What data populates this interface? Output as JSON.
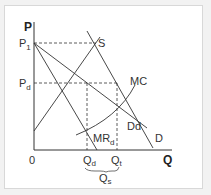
{
  "diagram": {
    "type": "economics-price-discrimination",
    "axes": {
      "y_label": "P",
      "x_label": "Q",
      "origin_label": "0"
    },
    "price_labels": [
      {
        "base": "P",
        "sub": "1"
      },
      {
        "base": "P",
        "sub": "d"
      }
    ],
    "quantity_labels": [
      {
        "base": "Q",
        "sub": "d"
      },
      {
        "base": "Q",
        "sub": "t"
      },
      {
        "base": "Q",
        "sub": "s"
      }
    ],
    "curves": [
      {
        "name": "S",
        "label": "S"
      },
      {
        "name": "MC",
        "label": "MC"
      },
      {
        "name": "Dd",
        "label": "Dd"
      },
      {
        "name": "D",
        "label": "D"
      },
      {
        "name": "MRd",
        "label_base": "MR",
        "label_sub": "d"
      }
    ],
    "colors": {
      "line": "#333333",
      "background": "#ffffff",
      "page": "#f2f2f2",
      "border": "#d8d8d8"
    }
  }
}
